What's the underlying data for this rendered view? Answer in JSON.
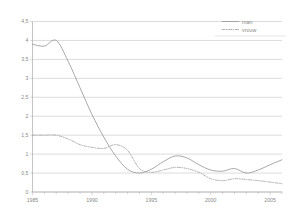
{
  "chart_data": {
    "type": "line",
    "title": "",
    "subtitle": "",
    "xlabel": "",
    "ylabel": "",
    "xlim": [
      1985,
      2006
    ],
    "ylim": [
      0,
      4.5
    ],
    "grid": true,
    "legend_position": "top-right",
    "x_tick_labels": [
      "1985",
      "1990",
      "1995",
      "2000",
      "2005"
    ],
    "x_tick_values": [
      1985,
      1990,
      1995,
      2000,
      2005
    ],
    "y_tick_labels": [
      "0",
      "0,5",
      "1",
      "1,5",
      "2",
      "2,5",
      "3",
      "3,5",
      "4",
      "4,5"
    ],
    "y_tick_values": [
      0,
      0.5,
      1,
      1.5,
      2,
      2.5,
      3,
      3.5,
      4,
      4.5
    ],
    "x": [
      1985,
      1986,
      1987,
      1988,
      1989,
      1990,
      1991,
      1992,
      1993,
      1994,
      1995,
      1996,
      1997,
      1998,
      1999,
      2000,
      2001,
      2002,
      2003,
      2004,
      2005,
      2006
    ],
    "series": [
      {
        "name": "man",
        "style": "solid",
        "color": "#9a9a9a",
        "values": [
          3.9,
          3.85,
          4.0,
          3.45,
          2.75,
          2.05,
          1.45,
          0.95,
          0.6,
          0.5,
          0.6,
          0.8,
          0.95,
          0.9,
          0.72,
          0.58,
          0.55,
          0.62,
          0.5,
          0.58,
          0.72,
          0.85
        ]
      },
      {
        "name": "vrouw",
        "style": "dash-dot",
        "color": "#a6a6a6",
        "values": [
          1.5,
          1.5,
          1.5,
          1.4,
          1.25,
          1.18,
          1.15,
          1.25,
          1.1,
          0.62,
          0.52,
          0.58,
          0.65,
          0.62,
          0.52,
          0.35,
          0.3,
          0.35,
          0.33,
          0.3,
          0.26,
          0.22
        ]
      }
    ]
  },
  "legend": {
    "entries": [
      {
        "label": "man",
        "swatch": "solid-line-swatch"
      },
      {
        "label": "vrouw",
        "swatch": "dashed-line-swatch"
      }
    ]
  }
}
